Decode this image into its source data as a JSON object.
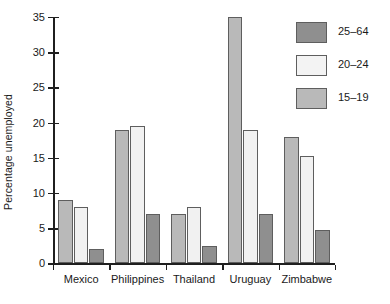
{
  "chart_data": {
    "type": "bar",
    "title": "",
    "subtitle": "",
    "xlabel": "",
    "ylabel": "Percentage unemployed",
    "ylim": [
      0,
      35
    ],
    "yticks": [
      0,
      5,
      10,
      15,
      20,
      25,
      30,
      35
    ],
    "ytick_labels": [
      "0",
      "5",
      "10",
      "15",
      "20",
      "25",
      "30",
      "35"
    ],
    "grid": false,
    "legend_position": "top-right",
    "categories": [
      "Mexico",
      "Philippines",
      "Thailand",
      "Uruguay",
      "Zimbabwe"
    ],
    "series": [
      {
        "name": "15–19",
        "color": "#b9b9b9",
        "values": [
          9,
          19,
          7,
          35,
          18
        ]
      },
      {
        "name": "20–24",
        "color": "#f1f1f1",
        "values": [
          8,
          19.5,
          8,
          19,
          15.3
        ]
      },
      {
        "name": "25–64",
        "color": "#8f8f8f",
        "values": [
          2,
          7,
          2.5,
          7,
          4.7
        ]
      }
    ],
    "legend_entries": [
      {
        "label": "25–64",
        "color": "#8f8f8f"
      },
      {
        "label": "20–24",
        "color": "#f3f3f3"
      },
      {
        "label": "15–19",
        "color": "#b9b9b9"
      }
    ],
    "axis_color": "#1f1f1f",
    "background_color": "#ffffff"
  }
}
